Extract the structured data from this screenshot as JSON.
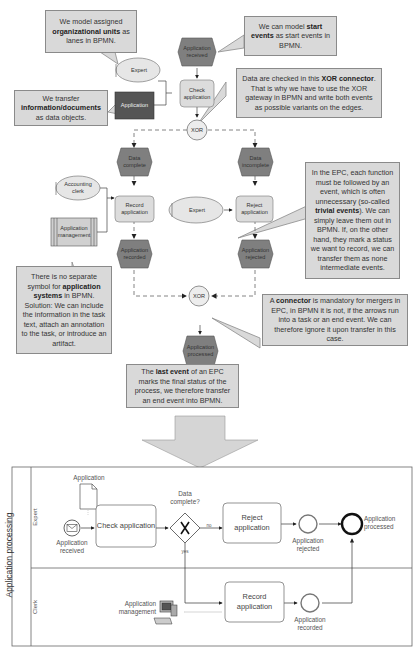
{
  "epc": {
    "events": {
      "application_received": "Application received",
      "data_complete": "Data complete",
      "data_incomplete": "Data incomplete",
      "application_recorded": "Application recorded",
      "application_rejected": "Application rejected",
      "application_processed": "Application processed"
    },
    "functions": {
      "check_application": "Check application",
      "record_application": "Record application",
      "reject_application": "Reject application"
    },
    "org_units": {
      "expert_top": "Expert",
      "accounting_clerk": "Accounting clerk",
      "expert_mid": "Expert"
    },
    "information_object": "Application",
    "application_system": "Application management",
    "connectors": {
      "split": "XOR",
      "merge": "XOR"
    }
  },
  "callouts": {
    "org_units": {
      "pre": "We model assigned ",
      "bold": "organizational units",
      "post": " as lanes in BPMN."
    },
    "start_events": {
      "pre": "We can model ",
      "bold": "start events",
      "post": " as start events in BPMN."
    },
    "info_objects": {
      "pre": "We transfer ",
      "bold": "information/documents",
      "post": " as data objects."
    },
    "xor_connector": {
      "pre": "Data are checked in this ",
      "bold": "XOR connector",
      "post": ". That is why we have to use the XOR gateway in BPMN and write both events as possible variants on the edges."
    },
    "trivial_events": {
      "pre": "In the EPC, each function must be followed by an event, which is often unnecessary (so-called ",
      "bold": "trivial events",
      "post": "). We can simply leave them out in BPMN. If, on the other hand, they mark a status we want to record, we can transfer them as none intermediate events."
    },
    "app_systems": {
      "pre": "There is no separate symbol for ",
      "bold": "application systems",
      "post": " in BPMN. Solution: We can include the information in the task text, attach an annotation to the task, or introduce an artifact."
    },
    "merge_connector": {
      "pre": "A ",
      "bold": "connector",
      "post": " is mandatory for mergers in EPC, in BPMN it is not, if the arrows run into a task or an end event. We can therefore ignore it upon transfer in this case."
    },
    "last_event": {
      "pre": "The ",
      "bold": "last event",
      "post": " of an EPC marks the final status of the process, we therefore transfer an end event into BPMN."
    }
  },
  "bpmn": {
    "pool": "Application processing",
    "lanes": {
      "expert": "Expert",
      "clerk": "Clerk"
    },
    "data_object": "Application",
    "start_event": "Application received",
    "tasks": {
      "check": "Check application",
      "reject": "Reject application",
      "record": "Record application"
    },
    "gateway": {
      "question": "Data complete?",
      "no": "no",
      "yes": "yes"
    },
    "intermediate_events": {
      "rejected": "Application rejected",
      "recorded": "Application recorded"
    },
    "end_event": "Application processed",
    "system_annotation": "Application management"
  },
  "colors": {
    "callout_bg": "#d9d9d9",
    "event_fill": "#7f7f7f",
    "function_fill": "#dcdcdc",
    "org_fill": "#e6e6e6",
    "info_fill": "#555555",
    "arrow_fill": "#d5d5d5"
  }
}
